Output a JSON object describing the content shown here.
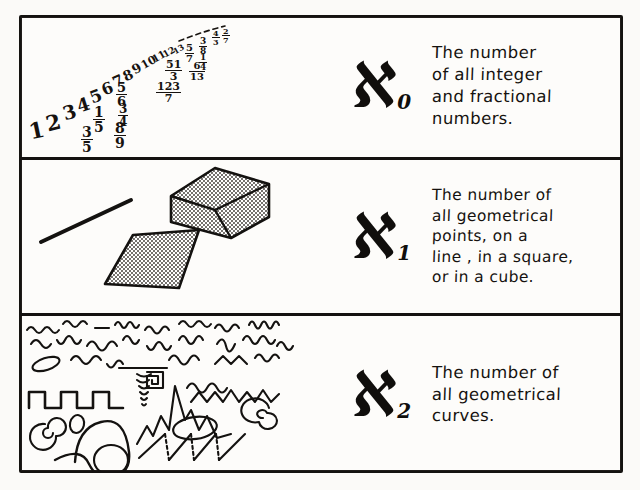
{
  "figure": {
    "background_color": "#fbfaf8",
    "ink_color": "#141210",
    "rows": [
      {
        "id": "row-aleph-0",
        "symbol": "ℵ",
        "subscript": "0",
        "caption_lines": [
          "The number",
          "of all integer",
          "and fractional",
          "numbers."
        ],
        "art_name": "integers-and-fractions-ladder"
      },
      {
        "id": "row-aleph-1",
        "symbol": "ℵ",
        "subscript": "1",
        "caption_lines": [
          "The number of",
          "all geometrical",
          "points, on a",
          "line , in a square,",
          "or in a cube."
        ],
        "art_name": "line-square-cube-figures"
      },
      {
        "id": "row-aleph-2",
        "symbol": "ℵ",
        "subscript": "2",
        "caption_lines": [
          "The number of",
          "all geometrical",
          "curves."
        ],
        "art_name": "assorted-curves-figures"
      }
    ]
  },
  "row1_art": {
    "integers": [
      "1",
      "2",
      "3",
      "4",
      "5",
      "6",
      "7",
      "8",
      "9",
      "10",
      "11",
      "12",
      "13"
    ],
    "fractions": [
      {
        "num": "3",
        "den": "5"
      },
      {
        "num": "1",
        "den": "5"
      },
      {
        "num": "8",
        "den": "9"
      },
      {
        "num": "3",
        "den": "4"
      },
      {
        "num": "5",
        "den": "6"
      },
      {
        "num": "123",
        "den": "7"
      },
      {
        "num": "51",
        "den": "3"
      },
      {
        "num": "6",
        "den": "13"
      },
      {
        "num": "5",
        "den": "7"
      },
      {
        "num": "3",
        "den": "8"
      },
      {
        "num": "1",
        "den": "4"
      },
      {
        "num": "4",
        "den": "3"
      },
      {
        "num": "2",
        "den": "7"
      }
    ]
  },
  "row2_art": {
    "shapes": [
      "line-segment",
      "cube",
      "square-parallelogram"
    ]
  },
  "row3_art": {
    "shapes": [
      "wavy-squiggles",
      "square-wave",
      "spiral-left",
      "spiral-right",
      "small-ellipse",
      "big-circle",
      "ellipse",
      "zigzag",
      "jagged-peak",
      "sine-curve",
      "small-oval",
      "hook-curve"
    ]
  }
}
